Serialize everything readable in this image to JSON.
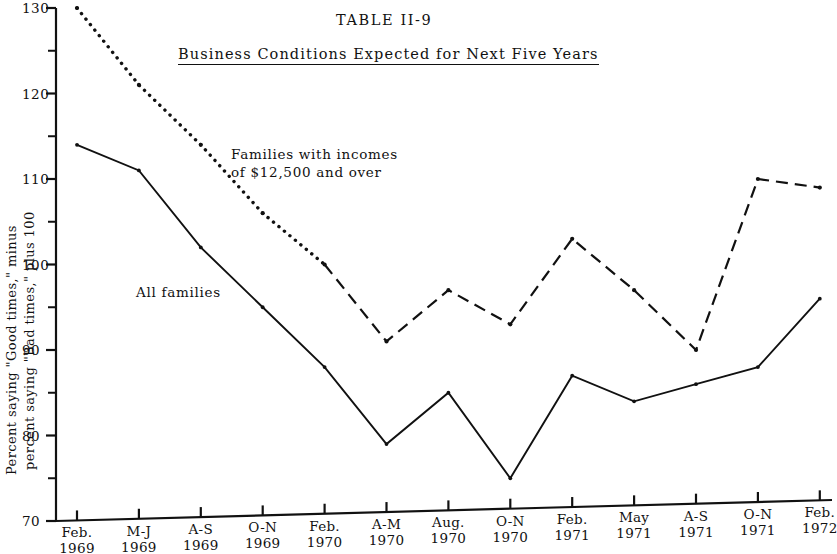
{
  "figure": {
    "table_number": "TABLE II-9",
    "subtitle": "Business Conditions Expected for Next Five Years",
    "ylabel_line1": "Percent saying \"Good times,\" minus",
    "ylabel_line2": "percent saying \"Bad times,\" plus 100",
    "annotations": {
      "high_income_line1": "Families with incomes",
      "high_income_line2": "of $12,500 and over",
      "all_families": "All families"
    }
  },
  "chart_data": {
    "type": "line",
    "title": "TABLE II-9",
    "subtitle": "Business Conditions Expected for Next Five Years",
    "xlabel": "",
    "ylabel": "Percent saying \"Good times,\" minus percent saying \"Bad times,\" plus 100",
    "ylim": [
      70,
      130
    ],
    "ytick_values": [
      70,
      80,
      90,
      100,
      110,
      120,
      130
    ],
    "ytick_labels": [
      "70",
      "80",
      "90",
      "100",
      "110",
      "120",
      "130"
    ],
    "yminor_values": [
      75,
      85,
      95,
      105,
      115,
      125
    ],
    "grid": false,
    "legend": "inline-annotations",
    "categories": [
      "Feb. 1969",
      "M-J 1969",
      "A-S 1969",
      "O-N 1969",
      "Feb. 1970",
      "A-M 1970",
      "Aug. 1970",
      "O-N 1970",
      "Feb. 1971",
      "May 1971",
      "A-S 1971",
      "O-N 1971",
      "Feb. 1972"
    ],
    "xtick_labels": [
      {
        "line1": "Feb.",
        "line2": "1969"
      },
      {
        "line1": "M-J",
        "line2": "1969"
      },
      {
        "line1": "A-S",
        "line2": "1969"
      },
      {
        "line1": "O-N",
        "line2": "1969"
      },
      {
        "line1": "Feb.",
        "line2": "1970"
      },
      {
        "line1": "A-M",
        "line2": "1970"
      },
      {
        "line1": "Aug.",
        "line2": "1970"
      },
      {
        "line1": "O-N",
        "line2": "1970"
      },
      {
        "line1": "Feb.",
        "line2": "1971"
      },
      {
        "line1": "May",
        "line2": "1971"
      },
      {
        "line1": "A-S",
        "line2": "1971"
      },
      {
        "line1": "O-N",
        "line2": "1971"
      },
      {
        "line1": "Feb.",
        "line2": "1972"
      }
    ],
    "series": [
      {
        "name": "Families with incomes of $12,500 and over",
        "style": "dotted-then-dashed",
        "color": "#111111",
        "values": [
          130,
          121,
          114,
          106,
          100,
          91,
          97,
          93,
          103,
          97,
          90,
          110,
          109
        ]
      },
      {
        "name": "All families",
        "style": "solid",
        "color": "#111111",
        "values": [
          114,
          111,
          102,
          95,
          88,
          79,
          85,
          75,
          87,
          84,
          86,
          88,
          96
        ]
      }
    ]
  }
}
